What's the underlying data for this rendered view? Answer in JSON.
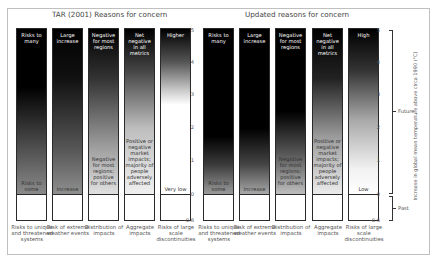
{
  "panels": [
    {
      "title": "TAR (2001) Reasons for concern",
      "columns": [
        {
          "top": "Risks to many",
          "bottom": "Risks to some",
          "category": "Risks to unique and threatened systems",
          "gradient": "linear-gradient(to bottom,#000 0%,#000 35%,#555 75%,#8a8a8a 100%)"
        },
        {
          "top": "Large increase",
          "bottom": "Increase",
          "category": "Risk of extreme weather events",
          "gradient": "linear-gradient(to bottom,#000 0%,#111 30%,#5a5a5a 75%,#8f8f8f 100%)"
        },
        {
          "top": "Negative for most regions",
          "bottom": "Negative for most regions; positive for others",
          "category": "Distribution of impacts",
          "gradient": "linear-gradient(to bottom,#000 0%,#333 30%,#9a9a9a 70%,#e0e0e0 100%)"
        },
        {
          "top": "Net negative in all metrics",
          "bottom": "Positive or negative market impacts; majority of people adversely affected",
          "category": "Aggregate impacts",
          "gradient": "linear-gradient(to bottom,#000 0%,#444 25%,#bdbdbd 60%,#f0f0f0 100%)"
        },
        {
          "top": "Higher",
          "bottom": "Very low",
          "category": "Risks of large scale discontinuities",
          "gradient": "linear-gradient(to bottom,#000 0%,#555 20%,#cfcfcf 38%,#fff 46%,#fff 100%)"
        }
      ]
    },
    {
      "title": "Updated reasons for concern",
      "columns": [
        {
          "top": "Risks to many",
          "bottom": "Risks to some",
          "category": "Risks to unique and threatened systems",
          "gradient": "linear-gradient(to bottom,#000 0%,#000 65%,#3a3a3a 82%,#9a9a9a 100%)"
        },
        {
          "top": "Large increase",
          "bottom": "Increase",
          "category": "Risk of extreme weather events",
          "gradient": "linear-gradient(to bottom,#000 0%,#000 60%,#444 82%,#a8a8a8 100%)"
        },
        {
          "top": "Negative for most regions",
          "bottom": "Negative for most regions; positive for others",
          "category": "Distribution of impacts",
          "gradient": "linear-gradient(to bottom,#000 0%,#000 50%,#555 75%,#bdbdbd 100%)"
        },
        {
          "top": "Net negative in all metrics",
          "bottom": "Positive or negative market impacts; majority of people adversely affected",
          "category": "Aggregate impacts",
          "gradient": "linear-gradient(to bottom,#000 0%,#222 30%,#9a9a9a 65%,#ececec 100%)"
        },
        {
          "top": "High",
          "bottom": "Low",
          "category": "Risks of large scale discontinuities",
          "gradient": "linear-gradient(to bottom,#000 0%,#333 25%,#a8a8a8 55%,#f2f2f2 85%,#fff 100%)"
        }
      ]
    }
  ],
  "axis": {
    "ticks": [
      "5",
      "4",
      "3",
      "2",
      "1",
      "0",
      "-0.6"
    ],
    "tick_values": [
      5,
      4,
      3,
      2,
      1,
      0,
      -0.6
    ],
    "label": "Increase in global mean temperature above circa 1990 (°C)",
    "future_label": "Future",
    "past_label": "Past"
  }
}
